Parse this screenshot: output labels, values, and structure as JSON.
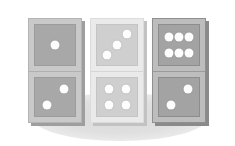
{
  "scene": {
    "title": "Three standing dominoes",
    "width": 235,
    "height": 146,
    "background_color": "#ffffff",
    "ground_shadow": {
      "name": "elliptical ground shadow",
      "color": "#dedede",
      "left": 32,
      "top": 93,
      "width": 176,
      "height": 48
    },
    "pip_color": "#fdfdfd"
  },
  "dominoes": [
    {
      "id": "domino-left",
      "label": "1 over 2",
      "tone": "tone-mid",
      "tile_color": "#c9c9c9",
      "face_color": "#a8a8a8",
      "edge_color": "#9e9e9e",
      "left": 28,
      "top": 18,
      "width": 54,
      "height": 105,
      "halves": [
        {
          "position": "top",
          "value": 1,
          "pips": [
            {
              "x": 50,
              "y": 50
            }
          ]
        },
        {
          "position": "bottom",
          "value": 2,
          "pips": [
            {
              "x": 72,
              "y": 30
            },
            {
              "x": 30,
              "y": 72
            }
          ]
        }
      ]
    },
    {
      "id": "domino-middle",
      "label": "3 over 4",
      "tone": "tone-light",
      "tile_color": "#eaeaea",
      "face_color": "#cfcfcf",
      "edge_color": "#c2c2c2",
      "left": 90,
      "top": 18,
      "width": 54,
      "height": 105,
      "halves": [
        {
          "position": "top",
          "value": 3,
          "pips": [
            {
              "x": 74,
              "y": 24
            },
            {
              "x": 50,
              "y": 50
            },
            {
              "x": 26,
              "y": 76
            }
          ]
        },
        {
          "position": "bottom",
          "value": 4,
          "pips": [
            {
              "x": 30,
              "y": 30
            },
            {
              "x": 72,
              "y": 30
            },
            {
              "x": 30,
              "y": 72
            },
            {
              "x": 72,
              "y": 72
            }
          ]
        }
      ]
    },
    {
      "id": "domino-right",
      "label": "6 over 2",
      "tone": "tone-dark",
      "tile_color": "#bdbdbd",
      "face_color": "#a3a3a3",
      "edge_color": "#8a8a8a",
      "left": 152,
      "top": 18,
      "width": 54,
      "height": 105,
      "halves": [
        {
          "position": "top",
          "value": 6,
          "pips": [
            {
              "x": 25,
              "y": 30
            },
            {
              "x": 50,
              "y": 30
            },
            {
              "x": 75,
              "y": 30
            },
            {
              "x": 25,
              "y": 70
            },
            {
              "x": 50,
              "y": 70
            },
            {
              "x": 75,
              "y": 70
            }
          ]
        },
        {
          "position": "bottom",
          "value": 2,
          "pips": [
            {
              "x": 72,
              "y": 30
            },
            {
              "x": 30,
              "y": 72
            }
          ]
        }
      ]
    }
  ]
}
